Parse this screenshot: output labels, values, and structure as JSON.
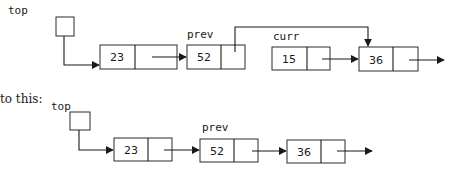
{
  "before": {
    "pointers": {
      "top": "top",
      "prev": "prev",
      "curr": "curr"
    },
    "nodes": [
      {
        "value": "23"
      },
      {
        "value": "52"
      },
      {
        "value": "15"
      },
      {
        "value": "36"
      }
    ]
  },
  "caption": "to this:",
  "after": {
    "pointers": {
      "top": "top",
      "prev": "prev"
    },
    "nodes": [
      {
        "value": "23"
      },
      {
        "value": "52"
      },
      {
        "value": "36"
      }
    ]
  },
  "colors": {
    "stroke": "#2b2b2b",
    "text": "#1a1a1a",
    "background": "#ffffff"
  }
}
